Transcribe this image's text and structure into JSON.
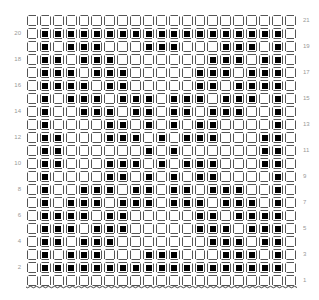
{
  "chart_data": {
    "type": "table",
    "title": "",
    "rows_count": 21,
    "cols_count": 21,
    "row_labels_left": [
      "20",
      "18",
      "16",
      "14",
      "12",
      "10",
      "8",
      "6",
      "4",
      "2"
    ],
    "row_labels_right": [
      "21",
      "19",
      "17",
      "15",
      "13",
      "11",
      "9",
      "7",
      "5",
      "3",
      "1"
    ],
    "grid_top_to_bottom": [
      {
        "row": 21,
        "cells": [
          0,
          0,
          0,
          0,
          0,
          0,
          0,
          0,
          0,
          0,
          0,
          0,
          0,
          0,
          0,
          0,
          0,
          0,
          0,
          0,
          0
        ]
      },
      {
        "row": 20,
        "cells": [
          0,
          1,
          1,
          1,
          1,
          1,
          1,
          1,
          1,
          1,
          1,
          1,
          1,
          1,
          1,
          1,
          1,
          1,
          1,
          1,
          0
        ]
      },
      {
        "row": 19,
        "cells": [
          0,
          1,
          0,
          1,
          1,
          1,
          0,
          0,
          0,
          1,
          1,
          1,
          0,
          0,
          0,
          1,
          1,
          1,
          0,
          1,
          0
        ]
      },
      {
        "row": 18,
        "cells": [
          0,
          1,
          1,
          0,
          1,
          1,
          1,
          0,
          0,
          0,
          0,
          0,
          0,
          0,
          1,
          1,
          1,
          0,
          1,
          1,
          0
        ]
      },
      {
        "row": 17,
        "cells": [
          0,
          1,
          1,
          1,
          0,
          1,
          1,
          1,
          0,
          0,
          0,
          0,
          0,
          1,
          1,
          1,
          0,
          1,
          1,
          1,
          0
        ]
      },
      {
        "row": 16,
        "cells": [
          0,
          1,
          1,
          1,
          1,
          0,
          1,
          1,
          0,
          0,
          0,
          0,
          0,
          1,
          1,
          0,
          1,
          1,
          1,
          1,
          0
        ]
      },
      {
        "row": 15,
        "cells": [
          0,
          1,
          0,
          1,
          1,
          1,
          0,
          1,
          1,
          1,
          0,
          1,
          1,
          1,
          0,
          1,
          1,
          1,
          0,
          1,
          0
        ]
      },
      {
        "row": 14,
        "cells": [
          0,
          1,
          0,
          0,
          1,
          1,
          1,
          0,
          1,
          1,
          0,
          1,
          1,
          0,
          1,
          1,
          1,
          0,
          0,
          1,
          0
        ]
      },
      {
        "row": 13,
        "cells": [
          0,
          1,
          0,
          0,
          0,
          0,
          1,
          1,
          0,
          1,
          0,
          1,
          0,
          1,
          1,
          0,
          0,
          0,
          0,
          1,
          0
        ]
      },
      {
        "row": 12,
        "cells": [
          0,
          1,
          1,
          0,
          0,
          0,
          1,
          1,
          1,
          0,
          1,
          0,
          1,
          1,
          1,
          0,
          0,
          0,
          1,
          1,
          0
        ]
      },
      {
        "row": 11,
        "cells": [
          0,
          1,
          1,
          0,
          0,
          0,
          0,
          0,
          0,
          1,
          0,
          1,
          0,
          0,
          0,
          0,
          0,
          0,
          1,
          1,
          0
        ]
      },
      {
        "row": 10,
        "cells": [
          0,
          1,
          1,
          0,
          0,
          0,
          1,
          1,
          1,
          0,
          1,
          0,
          1,
          1,
          1,
          0,
          0,
          0,
          1,
          1,
          0
        ]
      },
      {
        "row": 9,
        "cells": [
          0,
          1,
          0,
          0,
          0,
          0,
          1,
          1,
          0,
          1,
          0,
          1,
          0,
          1,
          1,
          0,
          0,
          0,
          0,
          1,
          0
        ]
      },
      {
        "row": 8,
        "cells": [
          0,
          1,
          0,
          0,
          1,
          1,
          1,
          0,
          1,
          1,
          0,
          1,
          1,
          0,
          1,
          1,
          1,
          0,
          0,
          1,
          0
        ]
      },
      {
        "row": 7,
        "cells": [
          0,
          1,
          0,
          1,
          1,
          1,
          0,
          1,
          1,
          1,
          0,
          1,
          1,
          1,
          0,
          1,
          1,
          1,
          0,
          1,
          0
        ]
      },
      {
        "row": 6,
        "cells": [
          0,
          1,
          1,
          1,
          1,
          0,
          1,
          1,
          0,
          0,
          0,
          0,
          0,
          1,
          1,
          0,
          1,
          1,
          1,
          1,
          0
        ]
      },
      {
        "row": 5,
        "cells": [
          0,
          1,
          1,
          1,
          0,
          1,
          1,
          1,
          0,
          0,
          0,
          0,
          0,
          1,
          1,
          1,
          0,
          1,
          1,
          1,
          0
        ]
      },
      {
        "row": 4,
        "cells": [
          0,
          1,
          1,
          0,
          1,
          1,
          1,
          0,
          0,
          0,
          0,
          0,
          0,
          0,
          1,
          1,
          1,
          0,
          1,
          1,
          0
        ]
      },
      {
        "row": 3,
        "cells": [
          0,
          1,
          0,
          1,
          1,
          1,
          0,
          0,
          0,
          1,
          1,
          1,
          0,
          0,
          0,
          1,
          1,
          1,
          0,
          1,
          0
        ]
      },
      {
        "row": 2,
        "cells": [
          0,
          1,
          1,
          1,
          1,
          1,
          1,
          1,
          1,
          1,
          1,
          1,
          1,
          1,
          1,
          1,
          1,
          1,
          1,
          1,
          0
        ]
      },
      {
        "row": 1,
        "cells": [
          0,
          0,
          0,
          0,
          0,
          0,
          0,
          0,
          0,
          0,
          0,
          0,
          0,
          0,
          0,
          0,
          0,
          0,
          0,
          0,
          0
        ]
      }
    ],
    "legend": [],
    "grid": true
  },
  "colors": {
    "filled": "#000000",
    "cell_border": "#555555",
    "label": "#999999",
    "background": "#ffffff"
  }
}
